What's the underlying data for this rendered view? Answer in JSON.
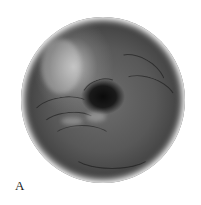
{
  "figure": {
    "panel_label": "A",
    "image_description": "Grayscale circular endoscopic illustration showing converging mucosal folds around a dark central lumen",
    "colors": {
      "background": "#ffffff",
      "lumen": "#0a0a0a",
      "mucosa": "#5a5a5a",
      "highlight": "#c8c8c8"
    }
  }
}
